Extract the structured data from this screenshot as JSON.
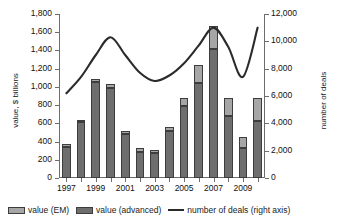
{
  "chart_data": {
    "type": "bar",
    "title": "",
    "xlabel": "",
    "ylabel": "value, $ billions",
    "y2label": "number of deals",
    "grid": false,
    "legend_position": "bottom",
    "ylim": [
      0,
      1800
    ],
    "y2lim": [
      0,
      12000
    ],
    "ytick_step": 200,
    "y2tick_step": 2000,
    "categories": [
      1997,
      1998,
      1999,
      2000,
      2001,
      2002,
      2003,
      2004,
      2005,
      2006,
      2007,
      2008,
      2009,
      2010
    ],
    "xtick_labels": [
      "1997",
      "1999",
      "2001",
      "2003",
      "2005",
      "2007",
      "2009"
    ],
    "ytick_labels": [
      "0",
      "200",
      "400",
      "600",
      "800",
      "1,000",
      "1,200",
      "1,400",
      "1,600",
      "1,800"
    ],
    "y2tick_labels": [
      "0",
      "2,000",
      "4,000",
      "6,000",
      "8,000",
      "10,000",
      "12,000"
    ],
    "series": [
      {
        "name": "value (advanced)",
        "axis": "left",
        "stack": "value",
        "color": "#6e6e6e",
        "values": [
          345,
          610,
          1050,
          990,
          485,
          285,
          275,
          515,
          795,
          1040,
          1420,
          680,
          325,
          630
        ]
      },
      {
        "name": "value (EM)",
        "axis": "left",
        "stack": "value",
        "color": "#a6a6a6",
        "values": [
          25,
          30,
          35,
          40,
          35,
          40,
          35,
          50,
          85,
          200,
          250,
          200,
          130,
          250
        ]
      },
      {
        "name": "number of deals (right axis)",
        "axis": "right",
        "type": "line",
        "color": "#2b2b2b",
        "values": [
          6200,
          7400,
          9000,
          10300,
          9000,
          7700,
          7100,
          7500,
          8400,
          9700,
          11000,
          9600,
          7400,
          11000
        ]
      }
    ],
    "totals_left": [
      370,
      640,
      1085,
      1030,
      520,
      325,
      310,
      565,
      880,
      1240,
      1670,
      880,
      455,
      880
    ],
    "legend": [
      {
        "label": "value (EM)",
        "marker": "swatch",
        "color": "#a6a6a6"
      },
      {
        "label": "value (advanced)",
        "marker": "swatch",
        "color": "#6e6e6e"
      },
      {
        "label": "number of deals (right axis)",
        "marker": "line",
        "color": "#2b2b2b"
      }
    ]
  }
}
